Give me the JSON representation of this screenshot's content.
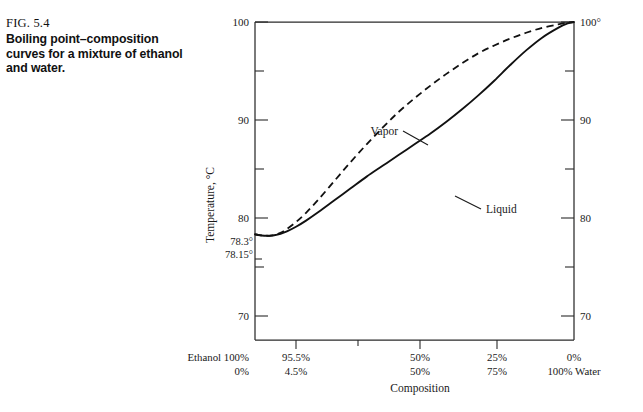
{
  "caption": {
    "figure_number": "FIG. 5.4",
    "text": "Boiling point–composition curves for a mixture of ethanol and water."
  },
  "chart_data": {
    "type": "line",
    "title": "",
    "xlabel": "Composition",
    "ylabel": "Temperature, °C",
    "xlim": [
      100,
      0
    ],
    "ylim": [
      67.5,
      100
    ],
    "grid": false,
    "legend": "inline-annotations",
    "y_axis": {
      "label": "Temperature, °C",
      "major_ticks": [
        "100",
        "90",
        "80",
        "70"
      ],
      "major_values": [
        100,
        90,
        80,
        70
      ],
      "minor_values": [
        95,
        85,
        75
      ],
      "right_ticks": [
        "100°",
        "90",
        "80",
        "70"
      ],
      "special_labels": [
        {
          "text": "78.3°",
          "value": 78.3
        },
        {
          "text": "78.15°",
          "value": 78.15
        }
      ]
    },
    "x_axis": {
      "label": "Composition",
      "left_legend_top": "Ethanol 100%",
      "left_legend_bottom": "0%",
      "right_legend_bottom": "100% Water",
      "ticks": [
        {
          "ethanol": "95.5%",
          "water": "4.5%",
          "x": 95.5
        },
        {
          "ethanol": "50%",
          "water": "50%",
          "x": 50
        },
        {
          "ethanol": "25%",
          "water": "75%",
          "x": 25
        },
        {
          "ethanol": "0%",
          "water": "",
          "x": 0
        }
      ]
    },
    "series": [
      {
        "name": "Liquid",
        "style": "solid",
        "annotation": "Liquid",
        "points": [
          [
            100,
            78.3
          ],
          [
            98.5,
            78.2
          ],
          [
            97,
            78.16
          ],
          [
            95.5,
            78.15
          ],
          [
            94,
            78.2
          ],
          [
            92,
            78.35
          ],
          [
            90,
            78.6
          ],
          [
            87,
            79.1
          ],
          [
            84,
            79.7
          ],
          [
            80,
            80.6
          ],
          [
            75,
            81.8
          ],
          [
            70,
            83.0
          ],
          [
            65,
            84.2
          ],
          [
            60,
            85.3
          ],
          [
            55,
            86.4
          ],
          [
            50,
            87.5
          ],
          [
            45,
            88.6
          ],
          [
            40,
            89.8
          ],
          [
            35,
            91.1
          ],
          [
            30,
            92.5
          ],
          [
            25,
            94.0
          ],
          [
            20,
            95.6
          ],
          [
            15,
            97.1
          ],
          [
            10,
            98.4
          ],
          [
            5,
            99.4
          ],
          [
            2,
            99.85
          ],
          [
            0,
            100
          ]
        ]
      },
      {
        "name": "Vapor",
        "style": "dashed",
        "annotation": "Vapor",
        "points": [
          [
            100,
            78.3
          ],
          [
            98.5,
            78.22
          ],
          [
            97,
            78.17
          ],
          [
            95.5,
            78.15
          ],
          [
            94,
            78.22
          ],
          [
            92,
            78.45
          ],
          [
            90,
            78.85
          ],
          [
            87,
            79.6
          ],
          [
            84,
            80.5
          ],
          [
            80,
            81.9
          ],
          [
            75,
            83.8
          ],
          [
            70,
            85.7
          ],
          [
            65,
            87.5
          ],
          [
            60,
            89.2
          ],
          [
            55,
            90.8
          ],
          [
            50,
            92.2
          ],
          [
            45,
            93.5
          ],
          [
            40,
            94.7
          ],
          [
            35,
            95.8
          ],
          [
            30,
            96.8
          ],
          [
            25,
            97.6
          ],
          [
            20,
            98.3
          ],
          [
            15,
            98.9
          ],
          [
            10,
            99.4
          ],
          [
            5,
            99.75
          ],
          [
            2,
            99.93
          ],
          [
            0,
            100
          ]
        ]
      }
    ],
    "annotations": [
      {
        "text": "Vapor",
        "series": "Vapor"
      },
      {
        "text": "Liquid",
        "series": "Liquid"
      }
    ]
  }
}
